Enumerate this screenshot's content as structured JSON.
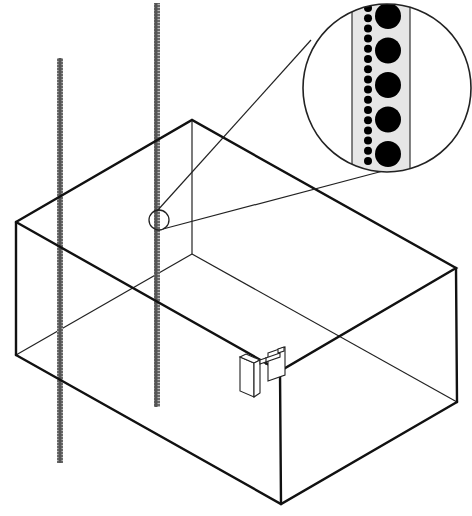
{
  "diagram": {
    "title": "Box enclosure with perforated vertical rails and magnified detail",
    "colors": {
      "line": "#111111",
      "rail": "#3a3a3a",
      "strip_fill": "#e6e6e6",
      "hole_fill": "#000000",
      "background": "#ffffff"
    },
    "box": {
      "top_left": [
        16,
        222
      ],
      "top_back": [
        192,
        120
      ],
      "top_right": [
        456,
        268
      ],
      "top_front": [
        280,
        371
      ],
      "bottom_left": [
        16,
        355
      ],
      "bottom_front": [
        281,
        504
      ],
      "bottom_right": [
        457,
        402
      ],
      "inner_back_bottom": [
        192,
        254
      ]
    },
    "rails": [
      {
        "name": "left-rail",
        "x": 60,
        "y_top": 58,
        "y_bottom": 463,
        "width": 6
      },
      {
        "name": "middle-rail",
        "x": 157,
        "y_top": 3,
        "y_bottom": 407,
        "width": 6
      }
    ],
    "detail_marker": {
      "cx": 159,
      "cy": 220,
      "r": 10
    },
    "magnifier": {
      "cx": 387,
      "cy": 88,
      "r": 84,
      "strip": {
        "x": 352,
        "width": 58
      },
      "small_holes": {
        "cx": 368,
        "r": 4,
        "count": 16,
        "y_start": 8,
        "spacing": 10.2
      },
      "large_holes": {
        "cx": 388,
        "r": 13,
        "count": 5,
        "y_start": 16,
        "spacing": 34.5
      }
    },
    "bracket": {
      "position": [
        240,
        345
      ]
    }
  }
}
